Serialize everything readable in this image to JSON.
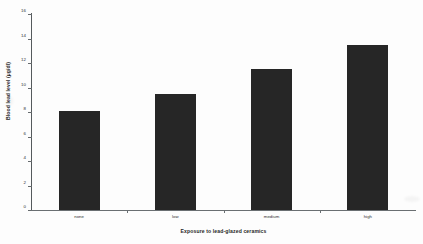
{
  "chart_data": {
    "type": "bar",
    "title": "",
    "subtitle": "",
    "xlabel": "Exposure to lead-glazed ceramics",
    "ylabel": "Blood lead level (µg/dl)",
    "categories": [
      "none",
      "low",
      "medium",
      "high"
    ],
    "values": [
      8.1,
      9.5,
      11.5,
      13.5
    ],
    "series": [
      {
        "name": "Blood lead level",
        "values": [
          8.1,
          9.5,
          11.5,
          13.5
        ]
      }
    ],
    "ylim": [
      0,
      16
    ],
    "y_ticks": [
      0,
      2,
      4,
      6,
      8,
      10,
      12,
      14,
      16
    ],
    "y_tick_labels": [
      "0",
      "2",
      "4",
      "6",
      "8",
      "10",
      "12",
      "14",
      "16"
    ],
    "grid": false,
    "legend": null,
    "legend_position": "none",
    "bar_color": "#262626",
    "axis_color": "#5f6467",
    "background_color": "#fdfdfd",
    "annotations": []
  }
}
